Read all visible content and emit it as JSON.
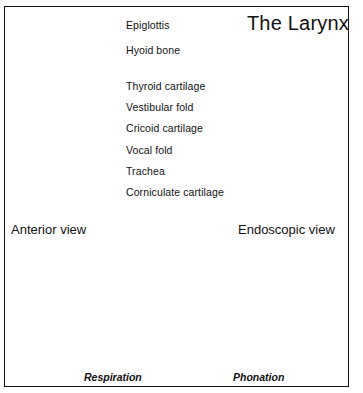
{
  "figure": {
    "title": "The Larynx",
    "background_color": "#ffffff",
    "border_color": "#111111"
  },
  "callout_labels": [
    {
      "id": "epiglottis",
      "text": "Epiglottis"
    },
    {
      "id": "hyoid-bone",
      "text": "Hyoid bone"
    },
    {
      "id": "thyroid-cartilage",
      "text": "Thyroid cartilage"
    },
    {
      "id": "vestibular-fold",
      "text": "Vestibular fold"
    },
    {
      "id": "cricoid-cartilage",
      "text": "Cricoid cartilage"
    },
    {
      "id": "vocal-fold",
      "text": "Vocal fold"
    },
    {
      "id": "trachea",
      "text": "Trachea"
    },
    {
      "id": "corniculate-cartilage",
      "text": "Corniculate cartilage"
    }
  ],
  "view_captions": {
    "anterior": "Anterior view",
    "endoscopic": "Endoscopic view"
  },
  "bottom_panels": [
    {
      "id": "respiration",
      "caption": "Respiration"
    },
    {
      "id": "phonation",
      "caption": "Phonation"
    }
  ]
}
